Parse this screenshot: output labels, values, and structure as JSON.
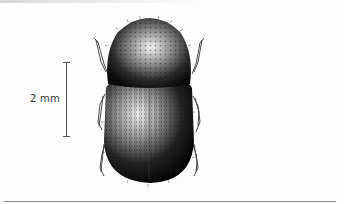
{
  "figure": {
    "scale_bar": {
      "label": "2 mm"
    }
  },
  "colors": {
    "background": "#fdfdfd",
    "ink": "#111111",
    "scale_bar": "#555555",
    "rule": "#8a8a8a"
  }
}
